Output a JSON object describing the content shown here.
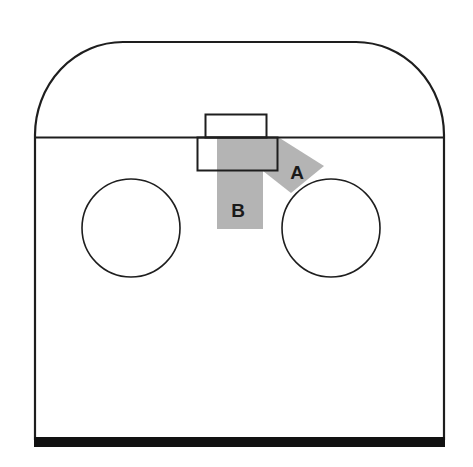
{
  "diagram": {
    "colors": {
      "stroke": "#1e1e1e",
      "shade": "#b4b4b4",
      "background": "#ffffff",
      "base": "#111111"
    },
    "regions": {
      "a": {
        "label": "A"
      },
      "b": {
        "label": "B"
      }
    },
    "shapes": {
      "outline": "room-outline-with-rounded-top",
      "divider": "horizontal-divider-line",
      "top_box": "upper-small-rectangle",
      "lower_box": "lower-wide-rectangle",
      "left_circle": "left-circle",
      "right_circle": "right-circle",
      "base": "thick-base-bar"
    }
  }
}
